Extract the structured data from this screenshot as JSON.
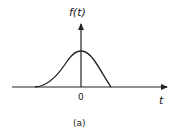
{
  "figure": {
    "y_axis_label": "f(t)",
    "x_axis_label": "t",
    "origin_label": "0",
    "caption": "(a)",
    "curve": "bell-shaped pulse centered at t = 0",
    "stroke_color": "#222222"
  }
}
